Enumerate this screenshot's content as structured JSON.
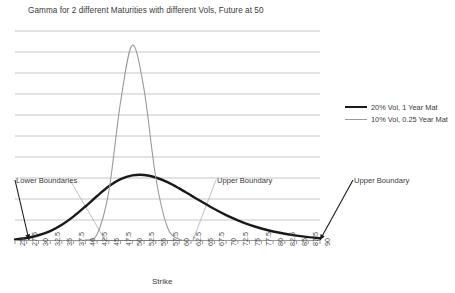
{
  "chart_data": {
    "type": "line",
    "title": "Gamma for 2 different Maturities with different Vols, Future at 50",
    "xlabel": "Strike",
    "ylabel": "",
    "grid": true,
    "legend_position": "right",
    "xlim": [
      25,
      90
    ],
    "ylim": [
      0,
      1.0
    ],
    "gridline_count": 10,
    "categories": [
      25,
      27.5,
      30,
      32.5,
      35,
      37.5,
      40,
      42.5,
      45,
      47.5,
      50,
      52.5,
      55,
      57.5,
      60,
      62.5,
      65,
      67.5,
      70,
      72.5,
      75,
      77.5,
      80,
      82.5,
      85,
      87.5,
      90
    ],
    "tick_labels": [
      "25",
      "27.5",
      "30",
      "32.5",
      "35",
      "37.5",
      "40",
      "42.5",
      "45",
      "47.5",
      "50",
      "52.5",
      "55",
      "57.5",
      "60",
      "62.5",
      "65",
      "67.5",
      "70",
      "72.5",
      "75",
      "77.5",
      "80",
      "82.5",
      "85",
      "87.5",
      "90"
    ],
    "series": [
      {
        "name": "20% Vol, 1 Year Mat",
        "color": "#1a1a1a",
        "width": 2.4,
        "values": [
          0.005,
          0.012,
          0.025,
          0.045,
          0.075,
          0.115,
          0.162,
          0.212,
          0.258,
          0.292,
          0.31,
          0.312,
          0.3,
          0.278,
          0.248,
          0.215,
          0.182,
          0.15,
          0.121,
          0.096,
          0.074,
          0.057,
          0.043,
          0.032,
          0.023,
          0.016,
          0.011
        ]
      },
      {
        "name": "10% Vol, 0.25 Year Mat",
        "color": "#9a9a9a",
        "width": 1.1,
        "values": [
          0.0,
          0.0,
          0.0,
          0.0,
          0.0,
          0.0,
          0.002,
          0.03,
          0.235,
          0.66,
          0.93,
          0.72,
          0.3,
          0.062,
          0.006,
          0.0,
          0.0,
          0.0,
          0.0,
          0.0,
          0.0,
          0.0,
          0.0,
          0.0,
          0.0,
          0.0,
          0.0
        ]
      }
    ],
    "annotations": [
      {
        "label": "Lower Boundaries",
        "x": 15,
        "y": 180,
        "arrow_color": "#1a1a1a",
        "target_x": 29,
        "target_y": 240
      },
      {
        "label": "Lower Boundaries (gray leader)",
        "label_hidden": true,
        "x": 70,
        "y": 180,
        "arrow_color": "#b0b0b0",
        "target_x": 105,
        "target_y": 240
      },
      {
        "label": "Upper Boundary",
        "x": 216,
        "y": 180,
        "arrow_color": "#b0b0b0",
        "target_x": 193,
        "target_y": 240
      },
      {
        "label": "Upper Boundary",
        "x": 353,
        "y": 180,
        "arrow_color": "#1a1a1a",
        "target_x": 320,
        "target_y": 240
      }
    ]
  },
  "title": "Gamma for 2 different Maturities with different Vols, Future at 50",
  "axis": {
    "x_title": "Strike"
  },
  "annotations": {
    "lower_boundaries": "Lower Boundaries",
    "upper_boundary_mid": "Upper Boundary",
    "upper_boundary_right": "Upper Boundary"
  },
  "legend": {
    "items": [
      {
        "label": "20% Vol, 1 Year Mat",
        "color": "#1a1a1a",
        "style": "thick"
      },
      {
        "label": "10% Vol, 0.25 Year Mat",
        "color": "#9a9a9a",
        "style": "thin"
      }
    ]
  },
  "colors": {
    "series_1": "#1a1a1a",
    "series_2": "#9a9a9a",
    "grid": "#b8b8b8",
    "axis": "#808080",
    "text": "#3a3a3a"
  }
}
